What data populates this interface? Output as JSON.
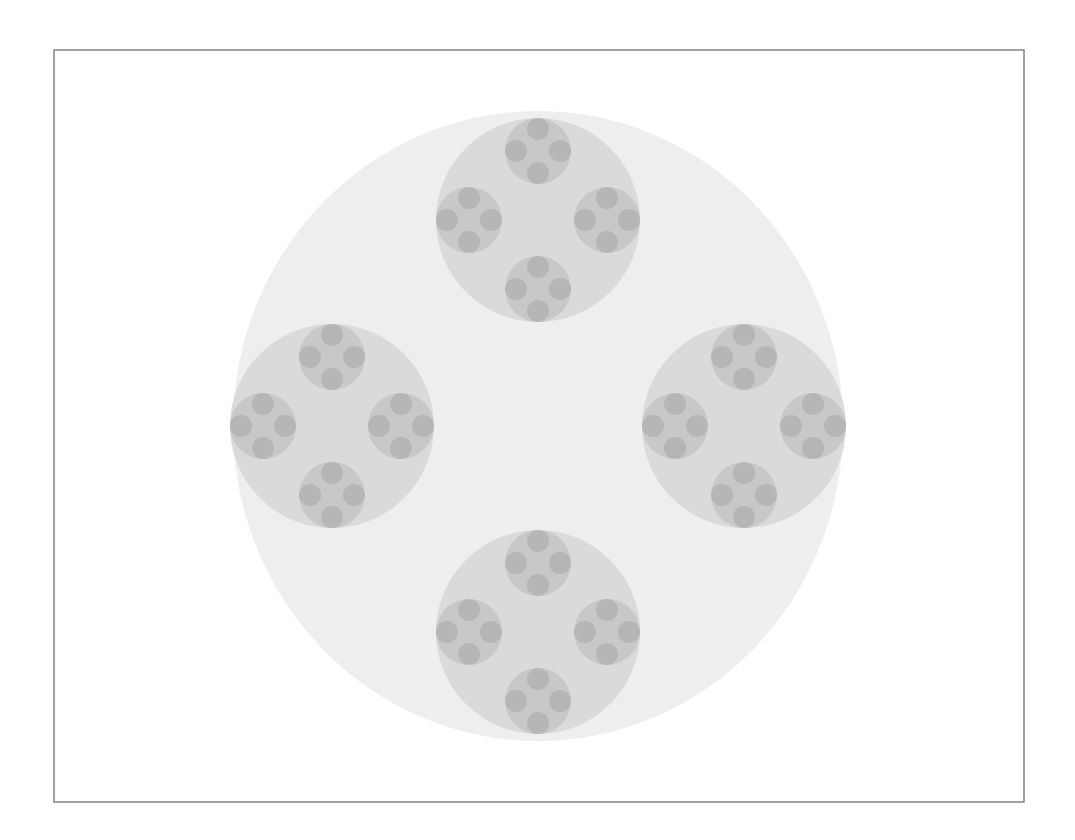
{
  "canvas": {
    "width": 1075,
    "height": 840,
    "background": "#ffffff"
  },
  "frame": {
    "x": 54,
    "y": 50,
    "width": 970,
    "height": 752,
    "stroke": "#8a8a8a",
    "stroke_width": 1.6,
    "fill": "#ffffff"
  },
  "fractal": {
    "center": [
      538,
      426
    ],
    "levels": [
      {
        "level": 0,
        "rx": 305,
        "ry": 315,
        "fill": "#f1f1f1"
      },
      {
        "level": 1,
        "r": 102,
        "offset": 206,
        "fill": "#dcdcdc"
      },
      {
        "level": 2,
        "r": 33,
        "offset": 69,
        "fill": "#c9c9c9"
      },
      {
        "level": 3,
        "r": 11,
        "offset": 22,
        "fill": "#b6b6b6"
      }
    ],
    "children_directions": [
      "top",
      "left",
      "right",
      "bottom"
    ]
  }
}
